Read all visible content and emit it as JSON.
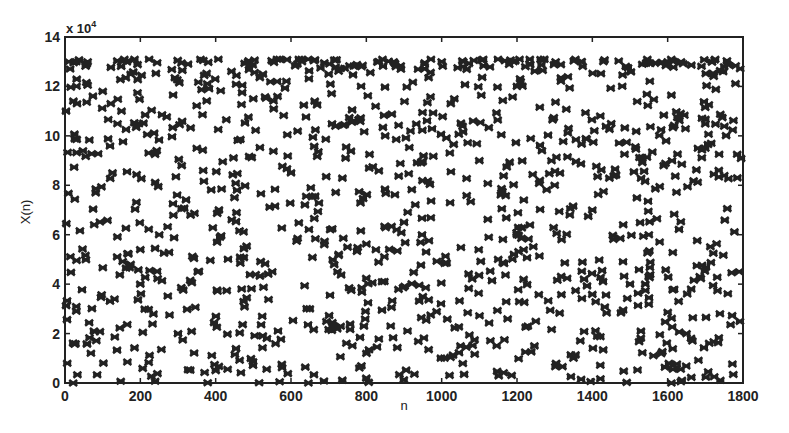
{
  "chart_data": {
    "type": "scatter",
    "title": "",
    "xlabel": "n",
    "ylabel": "X(n)",
    "y_multiplier_label": "x 10^4",
    "y_multiplier_base": "x 10",
    "y_multiplier_exp": "4",
    "xlim": [
      0,
      1800
    ],
    "ylim": [
      0,
      140000
    ],
    "x_ticks": [
      0,
      200,
      400,
      600,
      800,
      1000,
      1200,
      1400,
      1600,
      1800
    ],
    "y_ticks": [
      0,
      2,
      4,
      6,
      8,
      10,
      12,
      14
    ],
    "y_tick_labels": [
      "0",
      "2",
      "4",
      "6",
      "8",
      "10",
      "12",
      "14"
    ],
    "x_tick_labels": [
      "0",
      "200",
      "400",
      "600",
      "800",
      "1000",
      "1200",
      "1400",
      "1600",
      "1800"
    ],
    "marker": "x-star (dense)",
    "marker_color": "#222222",
    "grid": false,
    "legend": null,
    "series": [
      {
        "name": "X(n)",
        "n_points_approx": 1800,
        "value_range": [
          0,
          130000
        ],
        "sample_points": [
          [
            10,
            130000
          ],
          [
            30,
            130000
          ],
          [
            60,
            130000
          ],
          [
            100,
            118000
          ],
          [
            150,
            110000
          ],
          [
            200,
            40000
          ],
          [
            250,
            60000
          ],
          [
            300,
            20000
          ],
          [
            350,
            95000
          ],
          [
            400,
            5000
          ],
          [
            450,
            75000
          ],
          [
            500,
            115000
          ],
          [
            550,
            45000
          ],
          [
            600,
            85000
          ],
          [
            650,
            30000
          ],
          [
            700,
            125000
          ],
          [
            750,
            55000
          ],
          [
            800,
            2000
          ],
          [
            850,
            100000
          ],
          [
            900,
            65000
          ],
          [
            950,
            35000
          ],
          [
            1000,
            130000
          ],
          [
            1050,
            15000
          ],
          [
            1100,
            90000
          ],
          [
            1150,
            50000
          ],
          [
            1200,
            120000
          ],
          [
            1250,
            25000
          ],
          [
            1300,
            80000
          ],
          [
            1350,
            10000
          ],
          [
            1400,
            70000
          ],
          [
            1450,
            105000
          ],
          [
            1500,
            40000
          ],
          [
            1550,
            60000
          ],
          [
            1600,
            130000
          ],
          [
            1650,
            20000
          ],
          [
            1700,
            95000
          ],
          [
            1750,
            128000
          ],
          [
            1790,
            45000
          ]
        ]
      }
    ]
  }
}
